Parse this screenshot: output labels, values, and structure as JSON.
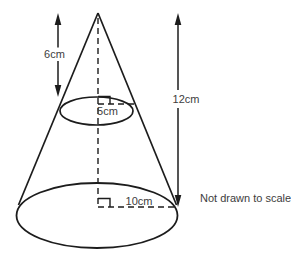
{
  "diagram": {
    "type": "cone-with-dimensions",
    "labels": {
      "upper_height": "6cm",
      "total_height": "12cm",
      "cross_section_radius": "5cm",
      "base_radius": "10cm",
      "note": "Not drawn to scale"
    },
    "colors": {
      "line": "#1c1c1c",
      "text": "#3d3d3d",
      "background": "#ffffff"
    }
  }
}
